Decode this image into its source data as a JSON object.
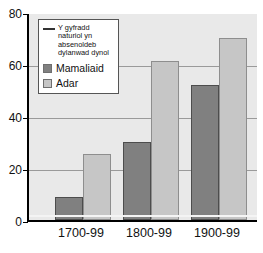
{
  "chart_data": {
    "type": "bar",
    "title": "",
    "subtitle": "",
    "xlabel": "",
    "ylabel": "",
    "categories": [
      "1700-99",
      "1800-99",
      "1900-99"
    ],
    "series": [
      {
        "name": "Mamaliaid",
        "values": [
          9,
          30,
          52
        ],
        "color": "#808080"
      },
      {
        "name": "Adar",
        "values": [
          25.5,
          61,
          70
        ],
        "color": "#c6c6c6"
      }
    ],
    "reference_line": {
      "label": "Y gyfradd naturiol yn absenoldeb dylanwad dynol",
      "value": 1,
      "color": "#f4f4f4"
    },
    "ylim": [
      0,
      80
    ],
    "yticks": [
      0,
      20,
      40,
      60,
      80
    ],
    "ytick_labels": [
      "0",
      "20",
      "40",
      "60",
      "80"
    ],
    "grid": true,
    "gridlines_at": [
      20,
      40,
      60
    ],
    "legend_position": "top-left-inside"
  },
  "legend": {
    "entries": [
      {
        "icon": "line-swatch",
        "lines": [
          "Y gyfradd",
          "naturiol yn",
          "absenoldeb",
          "dylanwad dynol"
        ]
      },
      {
        "icon": "box-swatch-dark",
        "label": "Mamaliaid"
      },
      {
        "icon": "box-swatch-light",
        "label": "Adar"
      }
    ]
  },
  "axes": {
    "y_tick_labels": [
      "80",
      "60",
      "40",
      "20",
      "0"
    ],
    "x_tick_labels": [
      "1700-99",
      "1800-99",
      "1900-99"
    ]
  },
  "colors": {
    "plot_background": "#e9e9e9",
    "page_background": "#ffffff",
    "axis": "#000000",
    "gridline": "#9a9a9a",
    "mammal": "#808080",
    "bird": "#c6c6c6"
  }
}
